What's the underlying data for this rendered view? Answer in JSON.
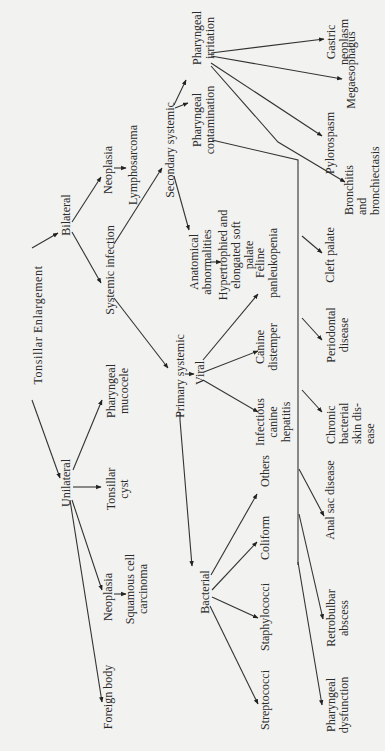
{
  "diagram": {
    "title": "Tonsillar Enlargement",
    "orientation": "rotated-90-ccw",
    "colors": {
      "background": "#f2f2f0",
      "ink": "#2a2a2a"
    },
    "nodes": {
      "root": {
        "lines": [
          "Tonsillar  Enlargement"
        ]
      },
      "bilateral": {
        "lines": [
          "Bilateral"
        ]
      },
      "unilateral": {
        "lines": [
          "Unilateral"
        ]
      },
      "neoplasia_bi": {
        "lines": [
          "Neoplasia"
        ]
      },
      "lymphosarcoma": {
        "lines": [
          "Lymphosarcoma"
        ]
      },
      "systemic_infection": {
        "lines": [
          "Systemic  infection"
        ]
      },
      "pharyngeal_mucocele": {
        "lines": [
          "Pharyngeal",
          "mucocele"
        ]
      },
      "tonsillar_cyst": {
        "lines": [
          "Tonsillar",
          "cyst"
        ]
      },
      "neoplasia_uni": {
        "lines": [
          "Neoplasia"
        ]
      },
      "squamous_cell_carcinoma": {
        "lines": [
          "Squamous cell",
          "carcinoma"
        ]
      },
      "foreign_body": {
        "lines": [
          "Foreign body"
        ]
      },
      "secondary_systemic": {
        "lines": [
          "Secondary systemic"
        ]
      },
      "primary_systemic": {
        "lines": [
          "Primary systemic"
        ]
      },
      "viral": {
        "lines": [
          "Viral"
        ]
      },
      "bacterial": {
        "lines": [
          "Bacterial"
        ]
      },
      "anatomical_abnormalities": {
        "lines": [
          "Anatomical",
          "abnormalities"
        ]
      },
      "hypertrophied_soft_palate": {
        "lines": [
          "Hypertrophied and",
          "elongated soft",
          "palate"
        ]
      },
      "pharyngeal_contamination": {
        "lines": [
          "Pharyngeal",
          "contamination"
        ]
      },
      "pharyngeal_irritation": {
        "lines": [
          "Pharyngeal",
          "irritation"
        ]
      },
      "feline_panleukopenia": {
        "lines": [
          "Feline",
          "panleukopenia"
        ]
      },
      "canine_distemper": {
        "lines": [
          "Canine",
          "distemper"
        ]
      },
      "infectious_canine_hepatitis": {
        "lines": [
          "Infectious",
          "canine",
          "hepatitis"
        ]
      },
      "others": {
        "lines": [
          "Others"
        ]
      },
      "coliform": {
        "lines": [
          "Coliform"
        ]
      },
      "staphylococci": {
        "lines": [
          "Staphylococci"
        ]
      },
      "streptococci": {
        "lines": [
          "Streptococci"
        ]
      },
      "gastric_neoplasm": {
        "lines": [
          "Gastric",
          "neoplasm"
        ]
      },
      "megaesophagus": {
        "lines": [
          "Megaesophagus"
        ]
      },
      "pylorospasm": {
        "lines": [
          "Pylorospasm"
        ]
      },
      "bronchitis_bronchiectasis": {
        "lines": [
          "Bronchitis",
          "and",
          "bronchiectasis"
        ]
      },
      "cleft_palate": {
        "lines": [
          "Cleft  palate"
        ]
      },
      "periodontal_disease": {
        "lines": [
          "Periodontal",
          "disease"
        ]
      },
      "chronic_bacterial_skin_disease": {
        "lines": [
          "Chronic",
          "bacterial",
          "skin dis-",
          "ease"
        ]
      },
      "anal_sac_disease": {
        "lines": [
          "Anal  sac disease"
        ]
      },
      "retrobulbar_abscess": {
        "lines": [
          "Retrobulbar",
          "abscess"
        ]
      },
      "pharyngeal_dysfunction": {
        "lines": [
          "Pharyngeal",
          "dysfunction"
        ]
      }
    },
    "edges": [
      [
        "root",
        "bilateral"
      ],
      [
        "root",
        "unilateral"
      ],
      [
        "bilateral",
        "neoplasia_bi"
      ],
      [
        "bilateral",
        "systemic_infection"
      ],
      [
        "neoplasia_bi",
        "lymphosarcoma"
      ],
      [
        "unilateral",
        "pharyngeal_mucocele"
      ],
      [
        "unilateral",
        "tonsillar_cyst"
      ],
      [
        "unilateral",
        "neoplasia_uni"
      ],
      [
        "unilateral",
        "foreign_body"
      ],
      [
        "neoplasia_uni",
        "squamous_cell_carcinoma"
      ],
      [
        "systemic_infection",
        "secondary_systemic"
      ],
      [
        "systemic_infection",
        "primary_systemic"
      ],
      [
        "secondary_systemic",
        "anatomical_abnormalities"
      ],
      [
        "secondary_systemic",
        "pharyngeal_contamination"
      ],
      [
        "secondary_systemic",
        "pharyngeal_irritation"
      ],
      [
        "anatomical_abnormalities",
        "hypertrophied_soft_palate"
      ],
      [
        "primary_systemic",
        "viral"
      ],
      [
        "primary_systemic",
        "bacterial"
      ],
      [
        "viral",
        "feline_panleukopenia"
      ],
      [
        "viral",
        "canine_distemper"
      ],
      [
        "viral",
        "infectious_canine_hepatitis"
      ],
      [
        "bacterial",
        "others"
      ],
      [
        "bacterial",
        "coliform"
      ],
      [
        "bacterial",
        "staphylococci"
      ],
      [
        "bacterial",
        "streptococci"
      ],
      [
        "pharyngeal_irritation",
        "gastric_neoplasm"
      ],
      [
        "pharyngeal_irritation",
        "megaesophagus"
      ],
      [
        "pharyngeal_irritation",
        "pylorospasm"
      ],
      [
        "pharyngeal_irritation",
        "bronchitis_bronchiectasis"
      ],
      [
        "pharyngeal_contamination",
        "cleft_palate"
      ],
      [
        "pharyngeal_contamination",
        "periodontal_disease"
      ],
      [
        "pharyngeal_contamination",
        "chronic_bacterial_skin_disease"
      ],
      [
        "pharyngeal_contamination",
        "anal_sac_disease"
      ],
      [
        "pharyngeal_contamination",
        "retrobulbar_abscess"
      ],
      [
        "pharyngeal_contamination",
        "pharyngeal_dysfunction"
      ]
    ]
  }
}
